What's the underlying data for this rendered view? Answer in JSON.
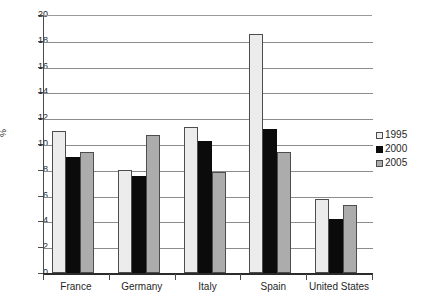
{
  "chart_data": {
    "type": "bar",
    "title": "",
    "xlabel": "",
    "ylabel": "%",
    "ylim": [
      0,
      20
    ],
    "ytick_step": 2,
    "yticks": [
      0,
      2,
      4,
      6,
      8,
      10,
      12,
      14,
      16,
      18,
      20
    ],
    "ytick_labels": [
      "0",
      "2",
      "4",
      "6",
      "8",
      "10",
      "12",
      "14",
      "16",
      "18",
      "20"
    ],
    "grid": true,
    "legend_position": "right",
    "categories": [
      "France",
      "Germany",
      "Italy",
      "Spain",
      "United States"
    ],
    "series": [
      {
        "name": "1995",
        "color": "#ececec",
        "values": [
          11.0,
          8.0,
          11.3,
          18.5,
          5.75
        ]
      },
      {
        "name": "2000",
        "color": "#0b0b0b",
        "values": [
          9.0,
          7.5,
          10.2,
          11.2,
          4.2
        ]
      },
      {
        "name": "2005",
        "color": "#acacac",
        "values": [
          9.35,
          10.7,
          7.8,
          9.35,
          5.25
        ]
      }
    ]
  },
  "legend": {
    "entries": [
      {
        "label": "1995",
        "swatch": "legend-swatch-1995"
      },
      {
        "label": "2000",
        "swatch": "legend-swatch-2000"
      },
      {
        "label": "2005",
        "swatch": "legend-swatch-2005"
      }
    ]
  },
  "axes": {
    "y_title": "%"
  }
}
